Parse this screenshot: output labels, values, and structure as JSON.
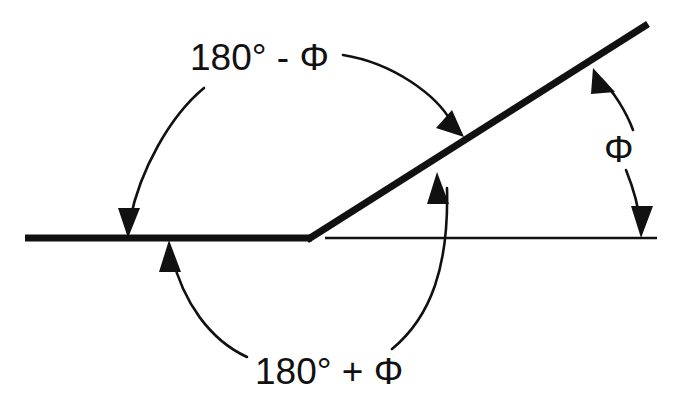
{
  "figure": {
    "type": "geometry-diagram",
    "background_color": "#ffffff",
    "stroke_color": "#111111"
  },
  "labels": {
    "top_angle": "180° - Φ",
    "bottom_angle": "180° + Φ",
    "right_angle": "Φ"
  },
  "geometry": {
    "vertex": {
      "x": 308,
      "y": 238
    },
    "thick_baseline": {
      "x1": 25,
      "y1": 238,
      "x2": 310,
      "y2": 238,
      "width": 6
    },
    "thick_ray": {
      "x1": 308,
      "y1": 238,
      "x2": 648,
      "y2": 24,
      "width": 6,
      "angle_deg": 32
    },
    "thin_baseline": {
      "x1": 325,
      "y1": 238,
      "x2": 657,
      "y2": 238,
      "width": 2
    }
  },
  "arcs": {
    "top": {
      "name": "180-minus-phi-arc",
      "left_branch": "M 204 88 C 168 118 138 170 129 222",
      "right_branch": "M 343 55 C 392 64 436 94 453 124",
      "arrow_start": {
        "x": 128,
        "y": 238,
        "direction": "down"
      },
      "arrow_end": {
        "x": 457,
        "y": 130,
        "direction": "down-right"
      }
    },
    "bottom": {
      "name": "180-plus-phi-arc",
      "left_branch": "M 245 357 C 209 338 182 300 171 254",
      "right_branch": "M 392 349 C 430 318 448 268 447 186",
      "arrow_start": {
        "x": 170,
        "y": 243,
        "direction": "up"
      },
      "arrow_end": {
        "x": 437,
        "y": 177,
        "direction": "up"
      }
    },
    "right": {
      "name": "phi-arc",
      "upper_branch": "M 632 132 C 625 112 612 91 600 78",
      "lower_branch": "M 626 168 C 634 188 639 208 640 224",
      "arrow_start": {
        "x": 596,
        "y": 73,
        "direction": "up-left"
      },
      "arrow_end": {
        "x": 641,
        "y": 232,
        "direction": "down"
      }
    }
  },
  "text_positions": {
    "top_angle": {
      "x": 190,
      "y": 70
    },
    "bottom_angle": {
      "x": 255,
      "y": 384
    },
    "right_angle": {
      "x": 604,
      "y": 162
    }
  }
}
